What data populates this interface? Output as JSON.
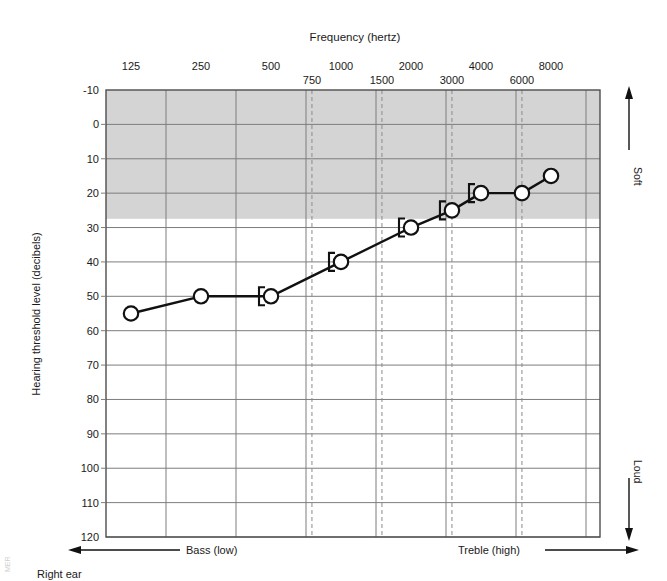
{
  "chart_data": {
    "type": "line",
    "title": "Frequency (hertz)",
    "xlabel": "Frequency (hertz)",
    "ylabel": "Hearing threshold level (decibels)",
    "caption": "Right ear",
    "credit": "MER",
    "x": [
      125,
      250,
      500,
      750,
      1000,
      1500,
      2000,
      3000,
      4000,
      6000,
      8000
    ],
    "series": [
      {
        "name": "Right ear air conduction",
        "marker": "circle",
        "x": [
          125,
          250,
          500,
          1000,
          2000,
          3000,
          4000,
          6000,
          8000
        ],
        "values": [
          55,
          50,
          50,
          40,
          30,
          25,
          20,
          20,
          15
        ]
      },
      {
        "name": "Right ear masked bone conduction",
        "marker": "bracket",
        "x": [
          500,
          1000,
          2000,
          3000,
          4000
        ],
        "values": [
          50,
          40,
          30,
          25,
          20
        ]
      }
    ],
    "xticks_major": [
      {
        "label": "125",
        "value": 125
      },
      {
        "label": "250",
        "value": 250
      },
      {
        "label": "500",
        "value": 500
      },
      {
        "label": "1000",
        "value": 1000
      },
      {
        "label": "2000",
        "value": 2000
      },
      {
        "label": "4000",
        "value": 4000
      },
      {
        "label": "8000",
        "value": 8000
      }
    ],
    "xticks_minor": [
      {
        "label": "750",
        "value": 750
      },
      {
        "label": "1500",
        "value": 1500
      },
      {
        "label": "3000",
        "value": 3000
      },
      {
        "label": "6000",
        "value": 6000
      }
    ],
    "yticks": [
      "-10",
      "0",
      "10",
      "20",
      "30",
      "40",
      "50",
      "60",
      "70",
      "80",
      "90",
      "100",
      "110",
      "120"
    ],
    "ylim": [
      -10,
      120
    ],
    "grid": true,
    "shaded_band": {
      "from": -10,
      "to": 25,
      "color": "#d4d4d4",
      "meaning": "normal hearing range"
    },
    "annotations": {
      "soft": "Soft",
      "loud": "Loud",
      "bass": "Bass (low)",
      "treble": "Treble (high)"
    },
    "legend_position": "none",
    "colors": {
      "line": "#111111",
      "grid": "#808080",
      "dashed_grid": "#8c8c8c",
      "frame": "#4d4d4d",
      "band": "#d4d4d4",
      "text": "#1a1a1a"
    }
  }
}
